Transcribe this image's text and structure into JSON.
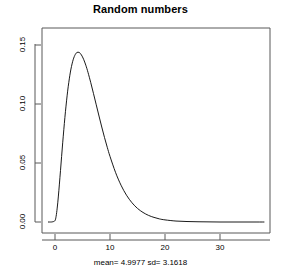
{
  "chart_data": {
    "type": "line",
    "title": "Random numbers",
    "subcaption": "mean= 4.9977 sd= 3.1618",
    "xlabel": "",
    "ylabel": "Density",
    "grid": false,
    "legend": "none",
    "box": "open-left-top-frame",
    "xlim": [
      -1.5,
      38.5
    ],
    "ylim": [
      -0.006,
      0.162
    ],
    "xticks": [
      0,
      10,
      20,
      30
    ],
    "xtick_labels": [
      "0",
      "10",
      "20",
      "30"
    ],
    "yticks": [
      0.0,
      0.05,
      0.1,
      0.15
    ],
    "ytick_labels": [
      "0.00",
      "0.05",
      "0.10",
      "0.15"
    ],
    "series": [
      {
        "name": "Density",
        "color": "#000000",
        "x": [
          -1.2,
          -0.8,
          -0.4,
          0.0,
          0.2,
          0.4,
          0.6,
          0.8,
          1.0,
          1.2,
          1.4,
          1.6,
          1.8,
          2.0,
          2.2,
          2.4,
          2.6,
          2.8,
          3.0,
          3.2,
          3.4,
          3.6,
          3.8,
          4.0,
          4.4,
          4.8,
          5.2,
          5.6,
          6.0,
          6.5,
          7.0,
          7.5,
          8.0,
          8.5,
          9.0,
          9.5,
          10.0,
          11.0,
          12.0,
          13.0,
          14.0,
          15.0,
          16.0,
          17.0,
          18.0,
          19.0,
          20.0,
          22.0,
          24.0,
          26.0,
          28.0,
          30.0,
          32.0,
          34.0,
          36.0,
          38.0
        ],
        "y": [
          0.0,
          0.0,
          0.0002,
          0.0012,
          0.0048,
          0.0118,
          0.0212,
          0.0321,
          0.0437,
          0.0555,
          0.0671,
          0.0782,
          0.0886,
          0.0982,
          0.1069,
          0.1146,
          0.1213,
          0.1271,
          0.1319,
          0.1358,
          0.1389,
          0.1412,
          0.1428,
          0.1437,
          0.1437,
          0.1416,
          0.1379,
          0.1329,
          0.1268,
          0.1181,
          0.1088,
          0.0993,
          0.0898,
          0.0805,
          0.0716,
          0.0633,
          0.0556,
          0.0421,
          0.0312,
          0.0227,
          0.0163,
          0.0115,
          0.0081,
          0.0056,
          0.0039,
          0.0026,
          0.0018,
          0.0008,
          0.0004,
          0.0002,
          0.0001,
          0.0,
          0.0,
          0.0,
          0.0,
          0.0
        ]
      }
    ],
    "peak": {
      "x": 2.7,
      "y": 0.153
    }
  },
  "chart": {
    "title": "Random numbers",
    "subcaption": "mean= 4.9977 sd= 3.1618",
    "ylabel": "Density",
    "xtick_labels": [
      "0",
      "10",
      "20",
      "30"
    ],
    "ytick_labels": [
      "0.00",
      "0.05",
      "0.10",
      "0.15"
    ]
  },
  "colors": {
    "curve": "#000000",
    "axis": "#4d4d4d",
    "background": "#ffffff",
    "text": "#000000"
  }
}
